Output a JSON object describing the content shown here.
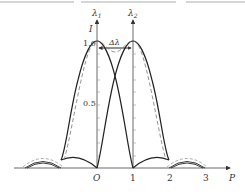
{
  "figure": {
    "labels": {
      "lambda1": "λ",
      "lambda1_sub": "1",
      "lambda2": "λ",
      "lambda2_sub": "2",
      "y_axis": "I",
      "delta_lambda": "Δλ",
      "x_axis": "P"
    },
    "y_ticks": [
      "1.0",
      "0.5"
    ],
    "x_ticks": [
      "O",
      "1",
      "2",
      "3"
    ],
    "curves": [
      {
        "name": "intensity-lambda1",
        "style": "solid",
        "center": 0
      },
      {
        "name": "intensity-lambda2",
        "style": "solid",
        "center": 1
      },
      {
        "name": "sum-intensity",
        "style": "dashed"
      }
    ]
  }
}
